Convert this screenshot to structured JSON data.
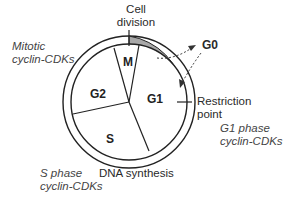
{
  "diagram": {
    "phases": [
      {
        "id": "M",
        "label": "M"
      },
      {
        "id": "G1",
        "label": "G1"
      },
      {
        "id": "S",
        "label": "S"
      },
      {
        "id": "G2",
        "label": "G2"
      }
    ],
    "outer_labels": {
      "cell_division": [
        "Cell",
        "division"
      ],
      "g0": "G0",
      "restriction_point": [
        "Restriction",
        "point"
      ],
      "dna_synthesis": "DNA synthesis"
    },
    "cdk_labels": {
      "mitotic": [
        "Mitotic",
        "cyclin-CDKs"
      ],
      "g1": [
        "G1 phase",
        "cyclin-CDKs"
      ],
      "s": [
        "S phase",
        "cyclin-CDKs"
      ]
    },
    "colors": {
      "stroke": "#222222",
      "band": "#a8a8a8",
      "arrow": "#333333"
    }
  }
}
